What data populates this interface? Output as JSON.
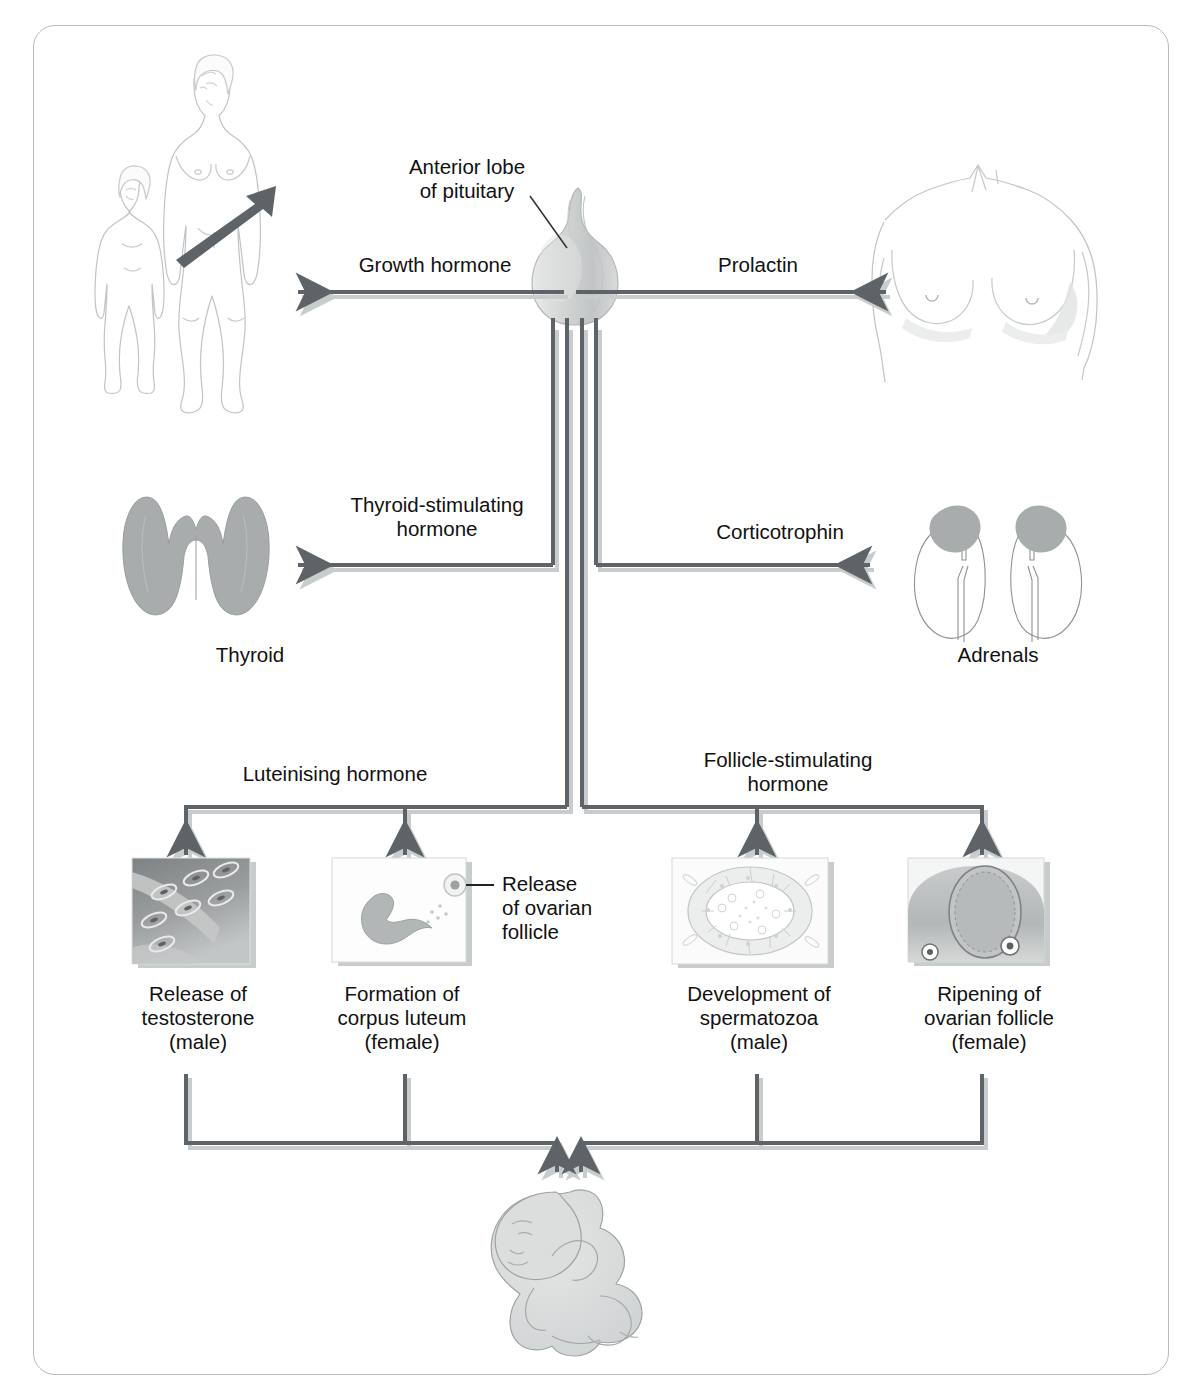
{
  "diagram": {
    "callouts": {
      "pituitary": "Anterior lobe\nof pituitary",
      "ovarian_release": "Release\nof ovarian\nfollicle"
    },
    "hormones": {
      "growth_hormone": "Growth hormone",
      "prolactin": "Prolactin",
      "tsh": "Thyroid-stimulating\nhormone",
      "corticotrophin": "Corticotrophin",
      "lh": "Luteinising hormone",
      "fsh": "Follicle-stimulating\nhormone"
    },
    "organs": {
      "thyroid": "Thyroid",
      "adrenals": "Adrenals"
    },
    "outcomes": [
      {
        "label": "Release of\ntestosterone\n(male)",
        "icon": "leydig-cells-micrograph"
      },
      {
        "label": "Formation of\ncorpus luteum\n(female)",
        "icon": "corpus-luteum-diagram"
      },
      {
        "label": "Development of\nspermatozoa\n(male)",
        "icon": "seminiferous-tubule-micrograph"
      },
      {
        "label": "Ripening of\novarian follicle\n(female)",
        "icon": "ovarian-follicle-diagram"
      }
    ],
    "figures": {
      "growth": "child-and-adult-figures",
      "breasts": "female-torso-breasts",
      "pituitary": "pituitary-gland",
      "thyroid": "thyroid-gland",
      "adrenals": "kidneys-with-adrenal-glands",
      "baby": "newborn-baby"
    },
    "colors": {
      "arrow": "#5d6367",
      "arrow_shadow": "#c9cccd",
      "outline": "#b9bcbe",
      "organ_fill": "#a9acad",
      "text": "#111111",
      "frame_border": "#b9bcbe"
    }
  }
}
